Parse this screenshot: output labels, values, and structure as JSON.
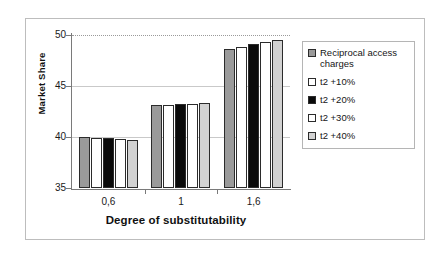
{
  "chart_data": {
    "type": "bar",
    "title": "",
    "xlabel": "Degree of substitutability",
    "ylabel": "Market Share",
    "categories": [
      "0,6",
      "1",
      "1,6"
    ],
    "ylim": [
      35,
      50
    ],
    "yticks": [
      35,
      40,
      45,
      50
    ],
    "grid": true,
    "legend_position": "right",
    "series": [
      {
        "name": "Reciprocal access charges",
        "values": [
          40.0,
          43.1,
          48.6
        ],
        "swatch": "dark-stipple"
      },
      {
        "name": "t2 +10%",
        "values": [
          39.95,
          43.15,
          48.8
        ],
        "swatch": "white"
      },
      {
        "name": "t2 +20%",
        "values": [
          39.9,
          43.2,
          49.1
        ],
        "swatch": "black"
      },
      {
        "name": "t2 +30%",
        "values": [
          39.8,
          43.25,
          49.35
        ],
        "swatch": "white"
      },
      {
        "name": "t2 +40%",
        "values": [
          39.7,
          43.35,
          49.5
        ],
        "swatch": "light-stipple"
      }
    ]
  },
  "axis": {
    "y_title": "Market Share",
    "x_title": "Degree of substitutability",
    "y_tick_labels": [
      "50",
      "45",
      "40",
      "35"
    ],
    "x_tick_labels": [
      "0,6",
      "1",
      "1,6"
    ]
  },
  "legend": {
    "entries": [
      {
        "label": "Reciprocal access charges"
      },
      {
        "label": "t2 +10%"
      },
      {
        "label": "t2 +20%"
      },
      {
        "label": "t2 +30%"
      },
      {
        "label": "t2 +40%"
      }
    ]
  }
}
